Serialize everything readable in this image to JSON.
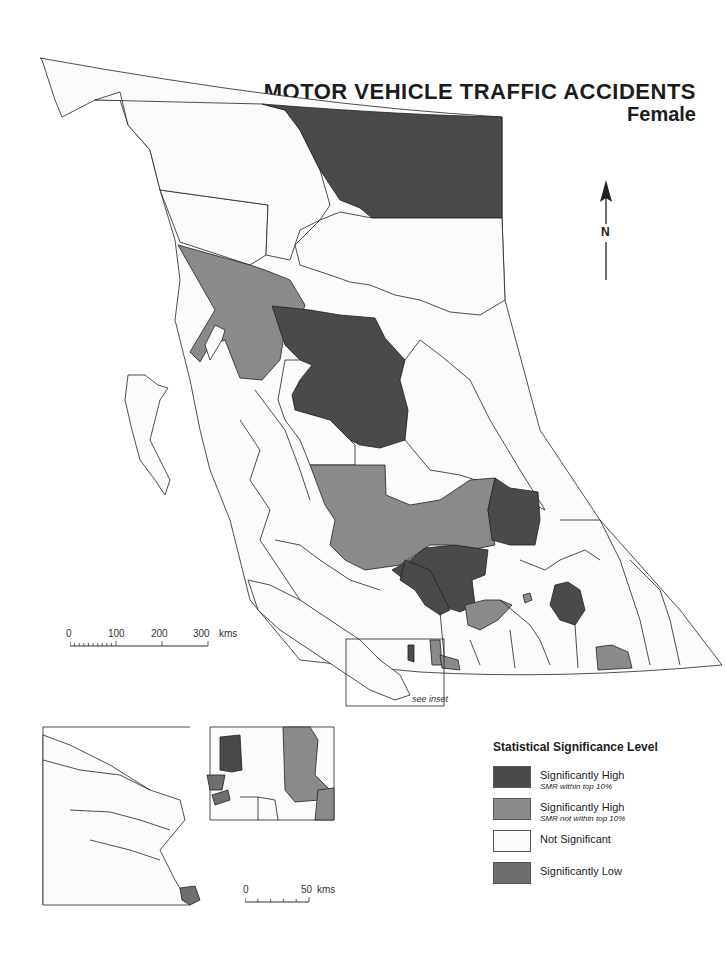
{
  "title": "MOTOR VEHICLE TRAFFIC ACCIDENTS",
  "subtitle": "Female",
  "north_arrow": {
    "label": "N",
    "icon": "north-arrow-icon"
  },
  "main_scale": {
    "ticks": [
      "0",
      "100",
      "200",
      "300"
    ],
    "unit": "kms"
  },
  "inset_scale": {
    "ticks": [
      "0",
      "50"
    ],
    "unit": "kms"
  },
  "inset_box_label": "see inset",
  "legend": {
    "title": "Statistical Significance Level",
    "items": [
      {
        "label": "Significantly High",
        "sublabel": "SMR within top 10%",
        "color": "#4a4a4a"
      },
      {
        "label": "Significantly High",
        "sublabel": "SMR not within top 10%",
        "color": "#8a8a8a"
      },
      {
        "label": "Not Significant",
        "sublabel": "",
        "color": "#fbfbfb"
      },
      {
        "label": "Significantly Low",
        "sublabel": "",
        "color": "#6f6f6f"
      }
    ]
  },
  "colors": {
    "sig_high_top10": "#4a4a4a",
    "sig_high_not_top10": "#8a8a8a",
    "not_significant": "#fbfbfb",
    "sig_low": "#6f6f6f",
    "border": "#222222"
  }
}
